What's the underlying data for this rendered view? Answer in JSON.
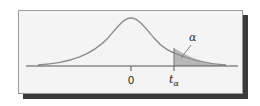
{
  "diagram": {
    "type": "t-distribution right-tail critical region",
    "center_label": "0",
    "critical_label": "t",
    "critical_subscript": "α",
    "area_label": "α",
    "colors": {
      "curve": "#8a8a8a",
      "shaded_area": "#b8b8b8",
      "axis": "#555555",
      "frame_bg": "#f4f4f4",
      "shadow": "#3a3a3a"
    }
  }
}
